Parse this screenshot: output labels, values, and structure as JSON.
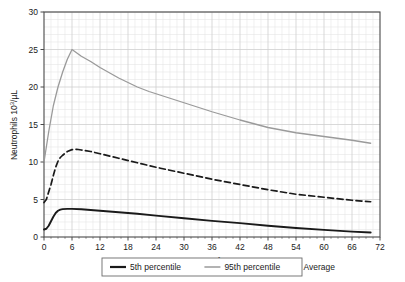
{
  "chart_data": {
    "type": "line",
    "title": "",
    "xlabel": "Hours of age",
    "ylabel": "Neutrophils 10",
    "ylabel_sup": "3",
    "ylabel_tail": "/µL",
    "xlim": [
      0,
      72
    ],
    "ylim": [
      0,
      30
    ],
    "xticks": [
      0,
      6,
      12,
      18,
      24,
      30,
      36,
      42,
      48,
      54,
      60,
      66,
      72
    ],
    "yticks": [
      0,
      5,
      10,
      15,
      20,
      25,
      30
    ],
    "xtick_labels": [
      "0",
      "6",
      "12",
      "18",
      "24",
      "30",
      "36",
      "42",
      "48",
      "54",
      "60",
      "66",
      "72"
    ],
    "ytick_labels": [
      "0",
      "5",
      "10",
      "15",
      "20",
      "25",
      "30"
    ],
    "x_minor_step": 1.5,
    "y_minor_step": 1,
    "grid": true,
    "grid_color": "#cfcfcf",
    "grid_minor_color": "#e6e6e6",
    "axis_color": "#4a4a4a",
    "legend_position": "below-outside",
    "series": [
      {
        "name": "5th percentile",
        "style": "solid",
        "color": "#1a1a1a",
        "width": 1.9,
        "points": [
          [
            0,
            1.0
          ],
          [
            0.5,
            1.1
          ],
          [
            1,
            1.5
          ],
          [
            1.5,
            2.1
          ],
          [
            2,
            2.7
          ],
          [
            2.5,
            3.2
          ],
          [
            3,
            3.5
          ],
          [
            3.5,
            3.65
          ],
          [
            4,
            3.72
          ],
          [
            5,
            3.75
          ],
          [
            6,
            3.75
          ],
          [
            8,
            3.7
          ],
          [
            10,
            3.6
          ],
          [
            12,
            3.5
          ],
          [
            16,
            3.3
          ],
          [
            20,
            3.1
          ],
          [
            24,
            2.85
          ],
          [
            30,
            2.5
          ],
          [
            36,
            2.15
          ],
          [
            42,
            1.85
          ],
          [
            48,
            1.5
          ],
          [
            54,
            1.2
          ],
          [
            60,
            0.95
          ],
          [
            66,
            0.72
          ],
          [
            70,
            0.6
          ]
        ]
      },
      {
        "name": "95th percentile",
        "style": "solid",
        "color": "#9a9a9a",
        "width": 1.3,
        "points": [
          [
            0,
            10.0
          ],
          [
            1,
            14.0
          ],
          [
            2,
            17.5
          ],
          [
            3,
            20.0
          ],
          [
            4,
            22.0
          ],
          [
            5,
            23.7
          ],
          [
            6,
            25.0
          ],
          [
            8,
            24.1
          ],
          [
            10,
            23.4
          ],
          [
            12,
            22.6
          ],
          [
            16,
            21.2
          ],
          [
            20,
            20.0
          ],
          [
            22.5,
            19.4
          ],
          [
            24,
            19.1
          ],
          [
            30,
            17.9
          ],
          [
            36,
            16.7
          ],
          [
            42,
            15.6
          ],
          [
            48,
            14.6
          ],
          [
            54,
            13.9
          ],
          [
            60,
            13.4
          ],
          [
            66,
            12.9
          ],
          [
            70,
            12.5
          ]
        ]
      },
      {
        "name": "Average",
        "style": "dashed",
        "color": "#1a1a1a",
        "width": 1.7,
        "points": [
          [
            0,
            4.6
          ],
          [
            0.5,
            5.0
          ],
          [
            1,
            6.0
          ],
          [
            1.5,
            7.0
          ],
          [
            2,
            8.2
          ],
          [
            2.5,
            9.3
          ],
          [
            3,
            10.1
          ],
          [
            3.5,
            10.6
          ],
          [
            4,
            10.9
          ],
          [
            5,
            11.4
          ],
          [
            6,
            11.65
          ],
          [
            7,
            11.7
          ],
          [
            8,
            11.6
          ],
          [
            10,
            11.4
          ],
          [
            12,
            11.1
          ],
          [
            16,
            10.5
          ],
          [
            20,
            9.9
          ],
          [
            24,
            9.3
          ],
          [
            30,
            8.5
          ],
          [
            36,
            7.7
          ],
          [
            42,
            7.0
          ],
          [
            48,
            6.3
          ],
          [
            54,
            5.7
          ],
          [
            60,
            5.3
          ],
          [
            66,
            4.9
          ],
          [
            70,
            4.7
          ]
        ]
      }
    ],
    "legend": [
      {
        "label": "5th percentile",
        "style": "solid",
        "color": "#1a1a1a",
        "width": 2.2,
        "sample": true
      },
      {
        "label": "95th percentile",
        "style": "solid",
        "color": "#9a9a9a",
        "width": 1.5,
        "sample": true
      },
      {
        "label": "Average",
        "style": "dashed",
        "color": "#1a1a1a",
        "width": 1.8,
        "sample": false
      }
    ]
  }
}
